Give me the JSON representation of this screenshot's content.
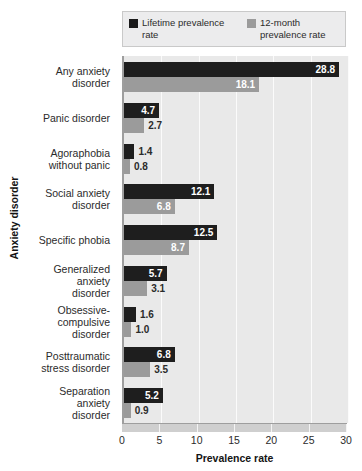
{
  "chart_data": {
    "type": "bar",
    "orientation": "horizontal",
    "title": "",
    "xlabel": "Prevalence rate",
    "ylabel": "Anxiety disorder",
    "xlim": [
      0,
      30
    ],
    "xticks": [
      0,
      5,
      10,
      15,
      20,
      25,
      30
    ],
    "grid": true,
    "legend_position": "top",
    "categories": [
      "Any anxiety\ndisorder",
      "Panic disorder",
      "Agoraphobia\nwithout panic",
      "Social anxiety\ndisorder",
      "Specific phobia",
      "Generalized\nanxiety\ndisorder",
      "Obsessive-\ncompulsive\ndisorder",
      "Posttraumatic\nstress disorder",
      "Separation\nanxiety\ndisorder"
    ],
    "series": [
      {
        "name": "Lifetime prevalence\nrate",
        "color": "#1e1e1e",
        "values": [
          28.8,
          4.7,
          1.4,
          12.1,
          12.5,
          5.7,
          1.6,
          6.8,
          5.2
        ]
      },
      {
        "name": "12-month\nprevalence rate",
        "color": "#9b9b9b",
        "values": [
          18.1,
          2.7,
          0.8,
          6.8,
          8.7,
          3.1,
          1.0,
          3.5,
          0.9
        ]
      }
    ]
  },
  "legend": {
    "entries": [
      {
        "label": "Lifetime prevalence\nrate",
        "swatch": "black"
      },
      {
        "label": "12-month\nprevalence rate",
        "swatch": "gray"
      }
    ]
  },
  "axes": {
    "x_title": "Prevalence rate",
    "y_title": "Anxiety disorder",
    "x_tick_labels": [
      "0",
      "5",
      "10",
      "15",
      "20",
      "25",
      "30"
    ]
  },
  "colors": {
    "lifetime": "#1e1e1e",
    "twelve_month": "#9b9b9b",
    "plot_background": "#e9e9e9",
    "gridline": "#fbfbfb",
    "axis": "#9e9e9e",
    "text": "#2b2b2b"
  }
}
